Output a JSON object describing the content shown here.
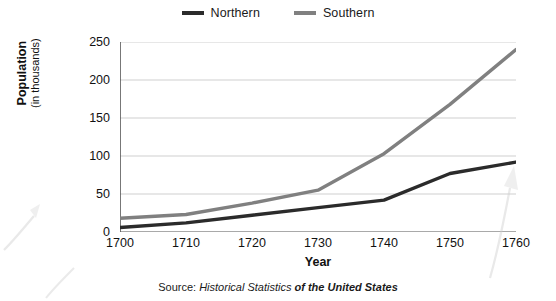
{
  "chart_data": {
    "type": "line",
    "title": "",
    "xlabel": "Year",
    "ylabel": "Population (in thousands)",
    "ylabel_line1": "Population",
    "ylabel_line2": "(in thousands)",
    "x": [
      1700,
      1710,
      1720,
      1730,
      1740,
      1750,
      1760
    ],
    "categories": [
      "1700",
      "1710",
      "1720",
      "1730",
      "1740",
      "1750",
      "1760"
    ],
    "xlim": [
      1700,
      1760
    ],
    "ylim": [
      0,
      250
    ],
    "yticks": [
      0,
      50,
      100,
      150,
      200,
      250
    ],
    "ytick_labels": [
      "0",
      "50",
      "100",
      "150",
      "200",
      "250"
    ],
    "grid": "horizontal",
    "legend_position": "top-center",
    "series": [
      {
        "name": "Northern",
        "color": "#2b2b2b",
        "values": [
          6,
          12,
          22,
          32,
          42,
          77,
          92
        ]
      },
      {
        "name": "Southern",
        "color": "#808080",
        "values": [
          18,
          23,
          38,
          55,
          103,
          168,
          240
        ]
      }
    ],
    "source_prefix": "Source: ",
    "source_italic": "Historical Statistics",
    "source_bold_italic": " of the United States",
    "source_full": "Source: Historical Statistics of the United States"
  },
  "legend": {
    "items": [
      {
        "label": "Northern",
        "color": "#2b2b2b"
      },
      {
        "label": "Southern",
        "color": "#808080"
      }
    ]
  },
  "axes": {
    "x_title": "Year",
    "y_title_line1": "Population",
    "y_title_line2": "(in thousands)"
  },
  "colors": {
    "northern": "#2b2b2b",
    "southern": "#808080",
    "grid": "#c9c9c9",
    "axis": "#555555",
    "background": "#ffffff",
    "text": "#1a1a1a"
  }
}
